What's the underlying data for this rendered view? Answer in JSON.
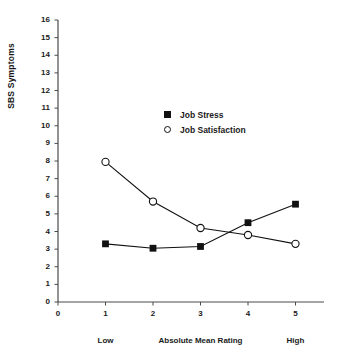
{
  "chart_data": {
    "type": "line",
    "title": "",
    "subtitle": "",
    "xlabel": "Absolute Mean Rating",
    "ylabel": "SBS Symptoms",
    "x": [
      1,
      2,
      3,
      4,
      5
    ],
    "xlim": [
      0,
      5.6
    ],
    "ylim": [
      0,
      16
    ],
    "grid": false,
    "legend_position": "upper-center",
    "x_tick_labels": [
      "0",
      "1",
      "2",
      "3",
      "4",
      "5"
    ],
    "y_tick_labels": [
      "0",
      "1",
      "2",
      "3",
      "4",
      "5",
      "6",
      "7",
      "8",
      "9",
      "10",
      "11",
      "12",
      "13",
      "14",
      "15",
      "16"
    ],
    "x_axis_annotations": [
      {
        "text": "Low",
        "at_x": 1
      },
      {
        "text": "Absolute Mean Rating",
        "at_x": 3
      },
      {
        "text": "High",
        "at_x": 5
      }
    ],
    "series": [
      {
        "name": "Job Stress",
        "marker": "filled-square",
        "color": "#111111",
        "values": [
          3.3,
          3.05,
          3.15,
          4.5,
          5.55
        ]
      },
      {
        "name": "Job Satisfaction",
        "marker": "open-circle",
        "color": "#111111",
        "values": [
          7.95,
          5.7,
          4.2,
          3.8,
          3.3
        ]
      }
    ]
  },
  "legend": {
    "entries": [
      {
        "label": "Job Stress",
        "marker": "filled-square-icon"
      },
      {
        "label": "Job Satisfaction",
        "marker": "open-circle-icon"
      }
    ]
  },
  "axes": {
    "y_title": "SBS Symptoms",
    "x_low_label": "Low",
    "x_center_label": "Absolute Mean Rating",
    "x_high_label": "High"
  }
}
